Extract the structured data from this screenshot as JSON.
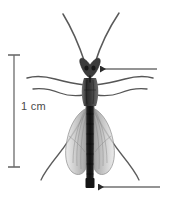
{
  "figure": {
    "background_color": "#ffffff",
    "width": 176,
    "height": 203
  },
  "scale_bar": {
    "label": "1 cm",
    "orientation": "vertical",
    "color": "#6b6b6b",
    "x": 14,
    "y_top": 55,
    "y_bottom": 167,
    "cap_half_width": 6,
    "length_px": 112
  },
  "annotations": [
    {
      "name": "head-pointer",
      "label": "",
      "target": "head",
      "direction": "left",
      "color": "#2b2b2b",
      "tip_x": 100,
      "tail_x": 157,
      "y": 69
    },
    {
      "name": "abdomen-tip-pointer",
      "label": "",
      "target": "abdomen tip",
      "direction": "left",
      "color": "#2b2b2b",
      "tip_x": 98,
      "tail_x": 160,
      "y": 187
    }
  ],
  "specimen": {
    "colors": {
      "body_dark": "#2a2a2a",
      "body_mid": "#4d4d4d",
      "wing_fill": "#c9c9c9",
      "wing_vein": "#8a8a8a",
      "leg": "#555555",
      "antenna": "#555555"
    },
    "parts": [
      {
        "name": "antenna-left",
        "count": 1
      },
      {
        "name": "antenna-right",
        "count": 1
      },
      {
        "name": "head",
        "count": 1
      },
      {
        "name": "thorax",
        "count": 1
      },
      {
        "name": "abdomen",
        "count": 1
      },
      {
        "name": "wing-left",
        "count": 1
      },
      {
        "name": "wing-right",
        "count": 1
      },
      {
        "name": "legs",
        "count": 6
      }
    ]
  }
}
